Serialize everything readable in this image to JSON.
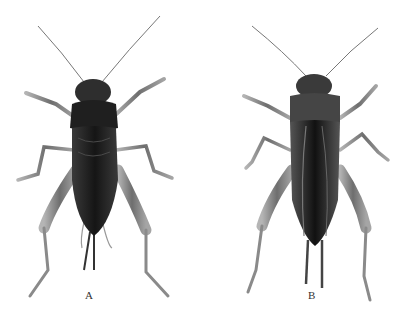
{
  "figure": {
    "panels": [
      {
        "id": "A",
        "label": "A",
        "subject": "cricket specimen, dorsal view (female, short wings, ovipositor)"
      },
      {
        "id": "B",
        "label": "B",
        "subject": "cricket specimen, dorsal view (long-winged)"
      }
    ],
    "colors": {
      "background": "#ffffff",
      "body_dark": "#1a1a1a",
      "legs": "#8a8a8a",
      "label": "#333333"
    }
  }
}
